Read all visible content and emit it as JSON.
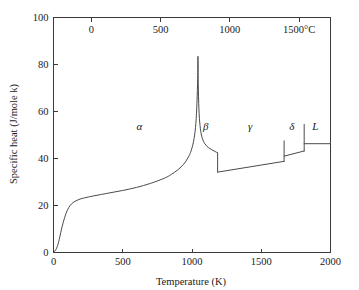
{
  "figure": {
    "background": "#ffffff",
    "line_color": "#4a4a4a",
    "axis_color": "#3a3a3a"
  },
  "chart_data": {
    "type": "line",
    "title": "",
    "xlabel": "Temperature (K)",
    "ylabel": "Specific heat (J/mole k)",
    "xlim": [
      0,
      2000
    ],
    "ylim": [
      0,
      100
    ],
    "grid": false,
    "legend": null,
    "x_ticks": [
      0,
      500,
      1000,
      1500,
      2000
    ],
    "x_tick_labels": [
      "0",
      "500",
      "1000",
      "1500",
      "2000"
    ],
    "y_ticks": [
      0,
      20,
      40,
      60,
      80,
      100
    ],
    "y_tick_labels": [
      "0",
      "20",
      "40",
      "60",
      "80",
      "100"
    ],
    "secondary_axis": {
      "position": "top",
      "label_suffix": "°C",
      "ticks_kelvin": [
        273,
        773,
        1273,
        1773
      ],
      "tick_labels": [
        "0",
        "500",
        "1000",
        "1500°C"
      ]
    },
    "annotations": [
      {
        "text": "α",
        "x": 620,
        "y": 52,
        "name": "phase-label-alpha"
      },
      {
        "text": "β",
        "x": 1100,
        "y": 52,
        "name": "phase-label-beta"
      },
      {
        "text": "γ",
        "x": 1420,
        "y": 52,
        "name": "phase-label-gamma"
      },
      {
        "text": "δ",
        "x": 1720,
        "y": 52,
        "name": "phase-label-delta"
      },
      {
        "text": "L",
        "x": 1890,
        "y": 52,
        "name": "phase-label-liquid"
      }
    ],
    "series": [
      {
        "name": "alpha-phase-debye-rise",
        "points": [
          [
            5,
            0.3
          ],
          [
            15,
            1.0
          ],
          [
            30,
            3.0
          ],
          [
            45,
            6.5
          ],
          [
            60,
            10.5
          ],
          [
            80,
            14.8
          ],
          [
            100,
            18.0
          ],
          [
            120,
            20.0
          ],
          [
            140,
            21.2
          ],
          [
            170,
            22.2
          ],
          [
            200,
            22.9
          ],
          [
            250,
            23.6
          ],
          [
            300,
            24.2
          ],
          [
            400,
            25.3
          ],
          [
            500,
            26.4
          ],
          [
            600,
            27.7
          ],
          [
            700,
            29.4
          ],
          [
            800,
            31.6
          ],
          [
            850,
            33.2
          ],
          [
            900,
            35.3
          ],
          [
            940,
            37.6
          ],
          [
            970,
            40.2
          ],
          [
            995,
            43.5
          ],
          [
            1015,
            48.5
          ],
          [
            1028,
            55.0
          ],
          [
            1036,
            64.0
          ],
          [
            1041,
            74.0
          ],
          [
            1043,
            83.3
          ]
        ]
      },
      {
        "name": "curie-peak-descent",
        "points": [
          [
            1043,
            83.3
          ],
          [
            1045,
            72.0
          ],
          [
            1050,
            61.0
          ],
          [
            1058,
            54.0
          ],
          [
            1070,
            49.5
          ],
          [
            1090,
            46.5
          ],
          [
            1120,
            44.6
          ],
          [
            1160,
            43.2
          ],
          [
            1185,
            42.4
          ]
        ]
      },
      {
        "name": "beta-to-gamma-drop",
        "points": [
          [
            1185,
            42.4
          ],
          [
            1185,
            34.2
          ]
        ]
      },
      {
        "name": "gamma-phase",
        "points": [
          [
            1185,
            34.2
          ],
          [
            1665,
            38.8
          ]
        ]
      },
      {
        "name": "gamma-to-delta-drop",
        "points": [
          [
            1665,
            38.8
          ],
          [
            1665,
            47.5
          ]
        ]
      },
      {
        "name": "delta-phase",
        "points": [
          [
            1665,
            41.0
          ],
          [
            1810,
            43.2
          ]
        ]
      },
      {
        "name": "delta-to-liquid-drop",
        "points": [
          [
            1810,
            43.2
          ],
          [
            1810,
            54.5
          ]
        ]
      },
      {
        "name": "liquid-phase",
        "points": [
          [
            1810,
            46.3
          ],
          [
            2000,
            46.3
          ]
        ]
      }
    ],
    "transitions": [
      {
        "name": "curie-point",
        "temperature_k": 1043,
        "label": "α→β"
      },
      {
        "name": "beta-gamma",
        "temperature_k": 1185,
        "label": "β→γ"
      },
      {
        "name": "gamma-delta",
        "temperature_k": 1665,
        "label": "γ→δ"
      },
      {
        "name": "delta-liquid",
        "temperature_k": 1810,
        "label": "δ→L"
      }
    ]
  }
}
